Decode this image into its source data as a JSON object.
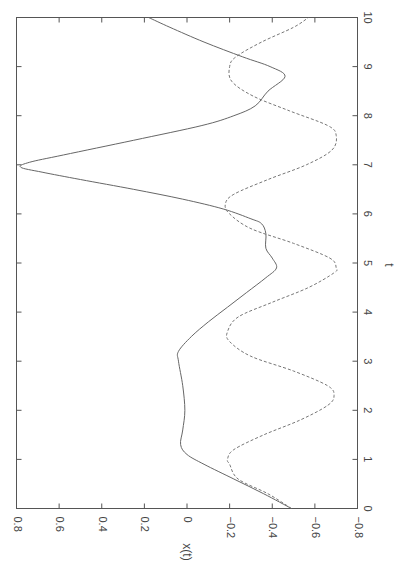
{
  "chart_data": {
    "type": "line",
    "title": "",
    "orientation": "rotated 90deg clockwise (t axis vertical on right, x(t) axis horizontal at bottom, reversed)",
    "xlabel": "t",
    "ylabel": "x(t)",
    "xlim": [
      0,
      10
    ],
    "ylim": [
      -0.8,
      0.8
    ],
    "grid": false,
    "legend": null,
    "t_ticks": [
      "0",
      "1",
      "2",
      "3",
      "4",
      "5",
      "6",
      "7",
      "8",
      "9",
      "10"
    ],
    "x_ticks": [
      "0.8",
      "0.6",
      "0.4",
      "0.2",
      "0",
      "-0.2",
      "-0.4",
      "-0.6",
      "-0.8"
    ],
    "series": [
      {
        "name": "solid",
        "style": "solid",
        "color": "#666666",
        "t": [
          0,
          0.3,
          0.6,
          0.9,
          1.1,
          1.3,
          1.6,
          2.0,
          2.5,
          3.0,
          3.2,
          3.5,
          3.8,
          4.1,
          4.4,
          4.7,
          4.9,
          5.1,
          5.3,
          5.6,
          5.8,
          5.9,
          6.1,
          6.3,
          6.5,
          6.7,
          6.85,
          6.95,
          7.05,
          7.2,
          7.5,
          7.8,
          8.0,
          8.2,
          8.5,
          8.8,
          9.0,
          9.2,
          9.5,
          9.8,
          10.0
        ],
        "values": [
          -0.49,
          -0.36,
          -0.22,
          -0.08,
          0.0,
          0.03,
          0.02,
          0.01,
          0.02,
          0.04,
          0.04,
          -0.02,
          -0.1,
          -0.19,
          -0.28,
          -0.37,
          -0.42,
          -0.4,
          -0.37,
          -0.37,
          -0.35,
          -0.3,
          -0.17,
          0.02,
          0.25,
          0.5,
          0.68,
          0.78,
          0.74,
          0.58,
          0.25,
          -0.07,
          -0.22,
          -0.32,
          -0.38,
          -0.46,
          -0.39,
          -0.26,
          -0.08,
          0.08,
          0.18
        ]
      },
      {
        "name": "dashed",
        "style": "dashed",
        "color": "#777777",
        "t": [
          0,
          0.3,
          0.6,
          0.9,
          1.0,
          1.2,
          1.5,
          1.8,
          2.1,
          2.3,
          2.5,
          2.8,
          3.1,
          3.4,
          3.6,
          3.9,
          4.2,
          4.5,
          4.8,
          4.9,
          5.1,
          5.4,
          5.7,
          6.0,
          6.2,
          6.4,
          6.7,
          7.0,
          7.3,
          7.6,
          7.8,
          8.1,
          8.4,
          8.7,
          9.0,
          9.2,
          9.5,
          9.8,
          10.0
        ],
        "values": [
          -0.49,
          -0.38,
          -0.24,
          -0.2,
          -0.19,
          -0.22,
          -0.36,
          -0.53,
          -0.66,
          -0.69,
          -0.66,
          -0.5,
          -0.3,
          -0.2,
          -0.19,
          -0.24,
          -0.4,
          -0.57,
          -0.69,
          -0.7,
          -0.67,
          -0.5,
          -0.3,
          -0.2,
          -0.18,
          -0.22,
          -0.38,
          -0.56,
          -0.68,
          -0.7,
          -0.66,
          -0.48,
          -0.31,
          -0.21,
          -0.2,
          -0.23,
          -0.35,
          -0.5,
          -0.57
        ]
      }
    ]
  },
  "axes": {
    "t_label": "t",
    "x_label": "x(t)"
  }
}
